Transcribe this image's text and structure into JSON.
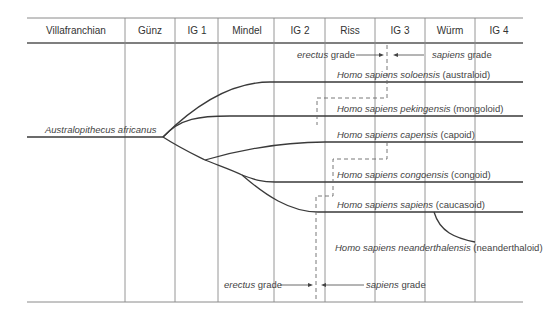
{
  "header": {
    "columns": [
      {
        "label": "Villafranchian",
        "x": 76
      },
      {
        "label": "Günz",
        "x": 150
      },
      {
        "label": "IG 1",
        "x": 197
      },
      {
        "label": "Mindel",
        "x": 247
      },
      {
        "label": "IG 2",
        "x": 300
      },
      {
        "label": "Riss",
        "x": 350
      },
      {
        "label": "IG 3",
        "x": 400
      },
      {
        "label": "Würm",
        "x": 450
      },
      {
        "label": "IG 4",
        "x": 499
      }
    ]
  },
  "root": {
    "label": "Australopithecus africanus"
  },
  "lineages": [
    {
      "italic": "Homo sapiens soloensis",
      "plain": " (australoid)"
    },
    {
      "italic": "Homo sapiens pekingensis",
      "plain": " (mongoloid)"
    },
    {
      "italic": "Homo sapiens capensis",
      "plain": " (capoid)"
    },
    {
      "italic": "Homo sapiens congoensis",
      "plain": " (congoid)"
    },
    {
      "italic": "Homo sapiens sapiens",
      "plain": " (caucasoid)"
    },
    {
      "italic": "Homo sapiens neanderthalensis",
      "plain": " (neanderthaloid)"
    }
  ],
  "grades": {
    "top_erectus_italic": "erectus",
    "top_erectus_plain": " grade",
    "top_sapiens_italic": "sapiens",
    "top_sapiens_plain": " grade",
    "bottom_erectus_italic": "erectus",
    "bottom_erectus_plain": " grade",
    "bottom_sapiens_italic": "sapiens",
    "bottom_sapiens_plain": " grade"
  },
  "colors": {
    "line": "#3a3a3a",
    "grid": "#8a8a8a",
    "dash": "#6a6a6a"
  }
}
